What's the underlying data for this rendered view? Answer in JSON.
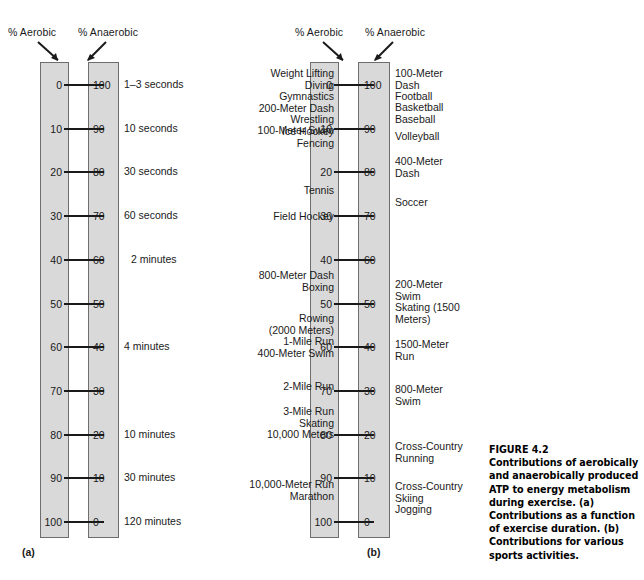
{
  "figure": {
    "number_label": "FIGURE 4.2",
    "caption": "Contributions of aerobically and anaerobically produced ATP to energy metabolism during exercise. (a) Contributions as a function of exercise duration. (b) Contributions for various sports activities.",
    "colors": {
      "bar_fill": "#d9d9d9",
      "bar_stroke": "#6d6d6d",
      "text": "#1a1a1a",
      "tick": "#1a1a1a",
      "background": "#ffffff"
    }
  },
  "panel_a": {
    "sub_caption": "(a)",
    "header_aerobic": "% Aerobic",
    "header_anaerobic": "% Anaerobic",
    "aerobic_ticks": [
      "0",
      "10",
      "20",
      "30",
      "40",
      "50",
      "60",
      "70",
      "80",
      "90",
      "100"
    ],
    "anaerobic_ticks": [
      "100",
      "90",
      "80",
      "70",
      "60",
      "50",
      "40",
      "30",
      "20",
      "10",
      "0"
    ],
    "duration_labels": [
      {
        "text": "1–3 seconds",
        "tick_index": 0
      },
      {
        "text": "10 seconds",
        "tick_index": 1
      },
      {
        "text": "30 seconds",
        "tick_index": 2
      },
      {
        "text": "60 seconds",
        "tick_index": 3
      },
      {
        "text": "2 minutes",
        "tick_index": 4
      },
      {
        "text": "4 minutes",
        "tick_index": 6
      },
      {
        "text": "10 minutes",
        "tick_index": 8
      },
      {
        "text": "30 minutes",
        "tick_index": 9
      },
      {
        "text": "120 minutes",
        "tick_index": 10
      }
    ]
  },
  "panel_b": {
    "sub_caption": "(b)",
    "header_aerobic": "% Aerobic",
    "header_anaerobic": "% Anaerobic",
    "aerobic_ticks": [
      "0",
      "10",
      "20",
      "30",
      "40",
      "50",
      "60",
      "70",
      "80",
      "90",
      "100"
    ],
    "anaerobic_ticks": [
      "100",
      "90",
      "80",
      "70",
      "60",
      "50",
      "40",
      "30",
      "20",
      "10",
      "0"
    ],
    "sports_left": [
      "Weight Lifting\nDiving\nGymnastics\n200-Meter Dash\nWrestling\nIce Hockey\nFencing",
      "100-Meter Swim",
      "Tennis",
      "Field Hockey",
      "800-Meter Dash\nBoxing",
      "Rowing\n(2000 Meters)\n1-Mile Run\n400-Meter Swim",
      "2-Mile Run",
      "3-Mile Run\nSkating\n10,000 Meters",
      "10,000-Meter Run\nMarathon"
    ],
    "sports_right": [
      "100-Meter\nDash\nFootball",
      "Basketball\nBaseball",
      "Volleyball",
      "400-Meter\nDash",
      "Soccer",
      "200-Meter\nSwim\nSkating (1500\nMeters)",
      "1500-Meter\nRun",
      "800-Meter\nSwim",
      "Cross-Country\nRunning",
      "Cross-Country\nSkiing\nJogging"
    ]
  },
  "geometry": {
    "tick_top_y": 85,
    "tick_step": 43.7,
    "bar_top": 62,
    "bar_bottom": 538
  }
}
